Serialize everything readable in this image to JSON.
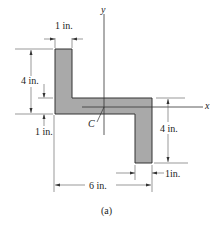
{
  "figure": {
    "caption": "(a)",
    "shape": "Z-section",
    "fill_color": "#a9a9a9",
    "axes": {
      "x_label": "x",
      "y_label": "y",
      "centroid_label": "C"
    },
    "dimensions": {
      "top_flange_width": "1 in.",
      "left_flange_height": "4 in.",
      "web_thickness": "1 in.",
      "right_flange_height": "4 in.",
      "right_flange_width": "1in.",
      "overall_width": "6 in."
    }
  }
}
